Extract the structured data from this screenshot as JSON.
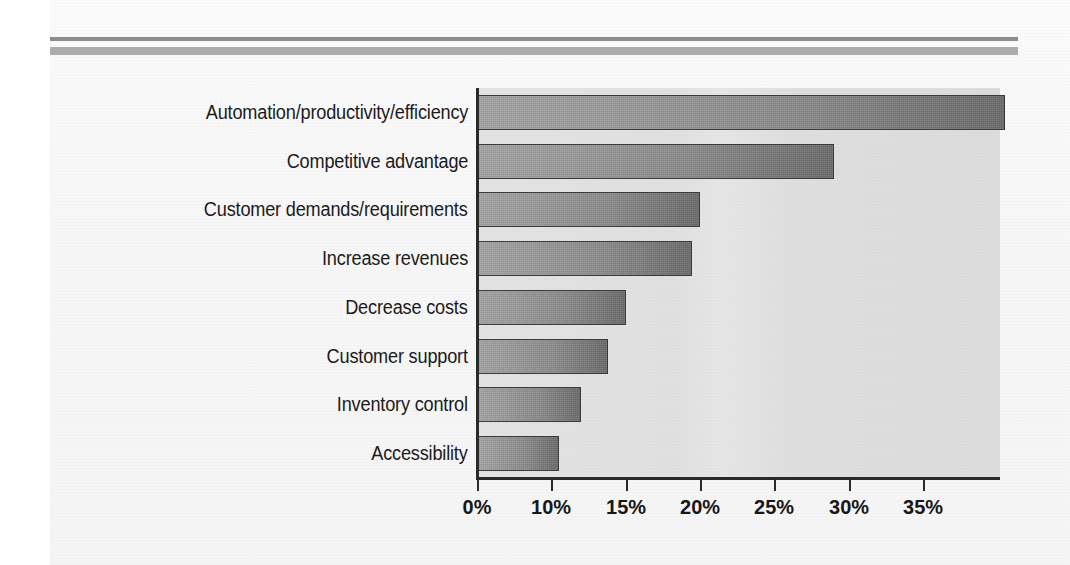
{
  "page": {
    "background_color": "#f7f7f7",
    "rule_thin_color": "#8d8d8d",
    "rule_thick_color": "#adadad"
  },
  "chart_data": {
    "type": "bar",
    "orientation": "horizontal",
    "title": "",
    "subtitle": "",
    "xlabel": "",
    "ylabel": "",
    "grid": false,
    "legend": null,
    "plot_background_color": "#e0e0e0",
    "bar_fill_start": "#a3a3a3",
    "bar_fill_end": "#6b6b6b",
    "bar_border_color": "#3a3a3a",
    "axis_color": "#2a2a2a",
    "xlim": [
      0,
      40
    ],
    "xtick_values": [
      0,
      5,
      10,
      15,
      20,
      25,
      30,
      35
    ],
    "xtick_labels": [
      "0%",
      "10%",
      "15%",
      "20%",
      "25%",
      "30%",
      "35%"
    ],
    "categories": [
      "Automation/productivity/efficiency",
      "Competitive advantage",
      "Customer demands/requirements",
      "Increase revenues",
      "Decrease costs",
      "Customer support",
      "Inventory control",
      "Accessibility"
    ],
    "values": [
      35.5,
      24.0,
      15.0,
      14.5,
      10.0,
      8.8,
      7.0,
      5.5
    ],
    "value_labels": [
      "35.5%",
      "24%",
      "15%",
      "14.5%",
      "10%",
      "8.8%",
      "7%",
      "5.5%"
    ]
  }
}
